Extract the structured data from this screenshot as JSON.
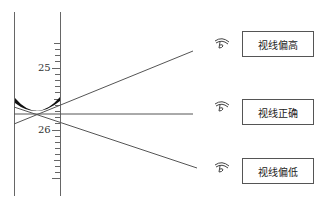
{
  "scale": {
    "labels": [
      {
        "text": "25",
        "y": 69
      },
      {
        "text": "26",
        "y": 130
      }
    ]
  },
  "sight_lines": [
    {
      "id": "high",
      "label": "视线偏高",
      "icon": "eye-icon"
    },
    {
      "id": "correct",
      "label": "视线正确",
      "icon": "eye-icon"
    },
    {
      "id": "low",
      "label": "视线偏低",
      "icon": "eye-icon"
    }
  ],
  "colors": {
    "line": "#555555",
    "meniscus": "#111111",
    "box_border": "#555555"
  }
}
